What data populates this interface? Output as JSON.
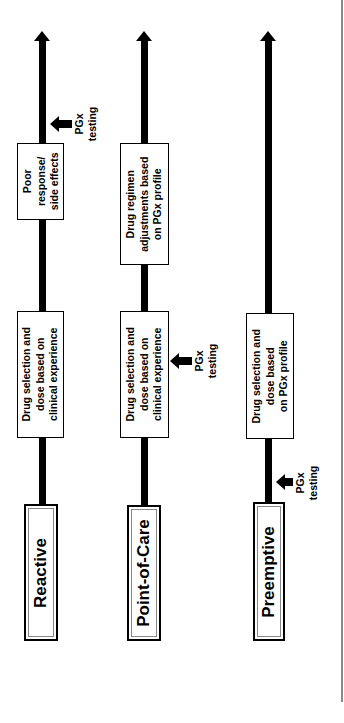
{
  "diagram": {
    "orientation": "rotated-90-ccw",
    "colors": {
      "line": "#000000",
      "box_fill": "#ffffff",
      "inner_border": "#888888",
      "page_rule": "#8a8a8a"
    },
    "timelines": [
      {
        "name": "Reactive",
        "label": "Reactive",
        "steps": [
          {
            "lines": [
              "Drug selection and",
              "dose based on",
              "clinical experience"
            ]
          },
          {
            "lines": [
              "Poor",
              "response/",
              "side effects"
            ]
          }
        ],
        "pgx_testing": {
          "lines": [
            "PGx",
            "testing"
          ],
          "position": "after poor response/side effects"
        }
      },
      {
        "name": "Point-of-Care",
        "label": "Point-of-Care",
        "steps": [
          {
            "lines": [
              "Drug selection and",
              "dose based on",
              "clinical experience"
            ]
          },
          {
            "lines": [
              "Drug regimen",
              "adjustments based",
              "on PGx profile"
            ]
          }
        ],
        "pgx_testing": {
          "lines": [
            "PGx",
            "testing"
          ],
          "position": "alongside initial drug selection"
        }
      },
      {
        "name": "Preemptive",
        "label": "Preemptive",
        "steps": [
          {
            "lines": [
              "Drug selection and",
              "dose based",
              "on PGx profile"
            ]
          }
        ],
        "pgx_testing": {
          "lines": [
            "PGx",
            "testing"
          ],
          "position": "before drug selection"
        }
      }
    ]
  }
}
